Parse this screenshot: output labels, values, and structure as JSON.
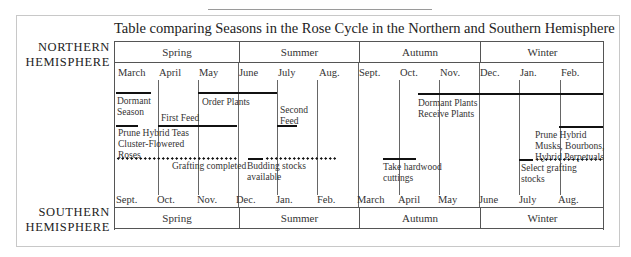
{
  "title": "Table comparing Seasons in the Rose Cycle in the Northern and Southern Hemisphere",
  "northern": {
    "label_line1": "NORTHERN",
    "label_line2": "HEMISPHERE",
    "seasons": [
      "Spring",
      "Summer",
      "Autumn",
      "Winter"
    ],
    "months": [
      "March",
      "April",
      "May",
      "June",
      "July",
      "Aug.",
      "Sept.",
      "Oct.",
      "Nov.",
      "Dec.",
      "Jan.",
      "Feb."
    ]
  },
  "southern": {
    "label_line1": "SOUTHERN",
    "label_line2": "HEMISPHERE",
    "seasons": [
      "Spring",
      "Summer",
      "Autumn",
      "Winter"
    ],
    "months": [
      "Sept.",
      "Oct.",
      "Nov.",
      "Dec.",
      "Jan.",
      "Feb.",
      "March",
      "April",
      "May",
      "June",
      "July",
      "Aug."
    ]
  },
  "activities": {
    "dormant_season": [
      "Dormant",
      "Season"
    ],
    "order_plants": "Order Plants",
    "first_feed": "First Feed",
    "second_feed": [
      "Second",
      "Feed"
    ],
    "prune_hybrid_teas": [
      "Prune Hybrid Teas",
      "Cluster-Flowered",
      "Roses"
    ],
    "grafting_completed": "Grafting completed",
    "budding_stocks": [
      "Budding stocks",
      "available"
    ],
    "dormant_plants": [
      "Dormant Plants",
      "Receive Plants"
    ],
    "take_hardwood": [
      "Take hardwood",
      "cuttings"
    ],
    "prune_hybrid_musks": [
      "Prune Hybrid",
      "Musks, Bourbons,",
      "Hybrid Perpetuals"
    ],
    "select_grafting": [
      "Select grafting",
      "stocks"
    ]
  },
  "colors": {
    "bar": "#111111",
    "grid": "#666666",
    "frame": "#c8c8c8"
  }
}
